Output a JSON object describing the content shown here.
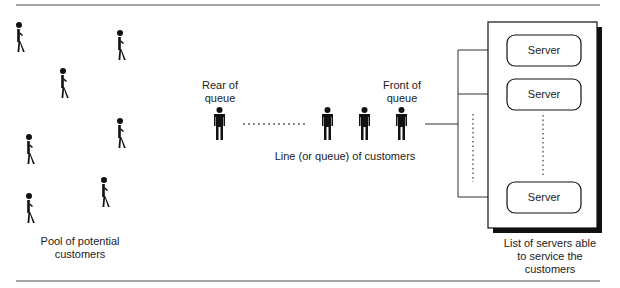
{
  "pool": {
    "label": "Pool of potential customers",
    "label_lines": [
      "Pool of potential",
      "customers"
    ],
    "count": 7
  },
  "queue": {
    "rear_label_lines": [
      "Rear of",
      "queue"
    ],
    "front_label_lines": [
      "Front of",
      "queue"
    ],
    "caption": "Line (or queue) of customers",
    "visible_customers": 4
  },
  "servers": {
    "items": [
      {
        "label": "Server"
      },
      {
        "label": "Server"
      },
      {
        "label": "Server"
      }
    ],
    "caption_lines": [
      "List of servers able",
      "to service the",
      "customers"
    ]
  },
  "colors": {
    "ink": "#111111",
    "rule": "#888888"
  }
}
